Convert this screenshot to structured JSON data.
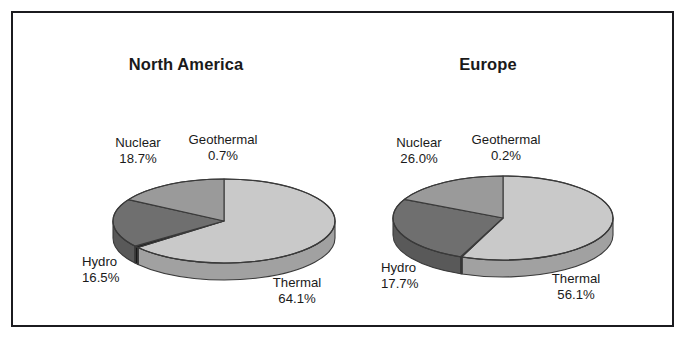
{
  "figure": {
    "border_color": "#1b1b1f",
    "background": "#ffffff"
  },
  "chart_data": [
    {
      "type": "pie",
      "title": "North America",
      "categories": [
        "Thermal",
        "Geothermal",
        "Nuclear",
        "Hydro"
      ],
      "values": [
        64.1,
        0.7,
        18.7,
        16.5
      ],
      "labels": [
        "64.1%",
        "0.7%",
        "18.7%",
        "16.5%"
      ],
      "colors": [
        "#c9c9c9",
        "#1e1e1e",
        "#6f6f6f",
        "#9a9a9a"
      ],
      "unit": "%",
      "legend": "none",
      "grid": false,
      "three_d": true
    },
    {
      "type": "pie",
      "title": "Europe",
      "categories": [
        "Thermal",
        "Geothermal",
        "Nuclear",
        "Hydro"
      ],
      "values": [
        56.1,
        0.2,
        26.0,
        17.7
      ],
      "labels": [
        "56.1%",
        "0.2%",
        "26.0%",
        "17.7%"
      ],
      "colors": [
        "#c9c9c9",
        "#1e1e1e",
        "#6f6f6f",
        "#9a9a9a"
      ],
      "unit": "%",
      "legend": "none",
      "grid": false,
      "three_d": true
    }
  ],
  "charts": {
    "north_america": {
      "title": "North America",
      "slices": {
        "thermal": {
          "name": "Thermal",
          "value": "64.1%"
        },
        "geothermal": {
          "name": "Geothermal",
          "value": "0.7%"
        },
        "nuclear": {
          "name": "Nuclear",
          "value": "18.7%"
        },
        "hydro": {
          "name": "Hydro",
          "value": "16.5%"
        }
      }
    },
    "europe": {
      "title": "Europe",
      "slices": {
        "thermal": {
          "name": "Thermal",
          "value": "56.1%"
        },
        "geothermal": {
          "name": "Geothermal",
          "value": "0.2%"
        },
        "nuclear": {
          "name": "Nuclear",
          "value": "26.0%"
        },
        "hydro": {
          "name": "Hydro",
          "value": "17.7%"
        }
      }
    }
  }
}
